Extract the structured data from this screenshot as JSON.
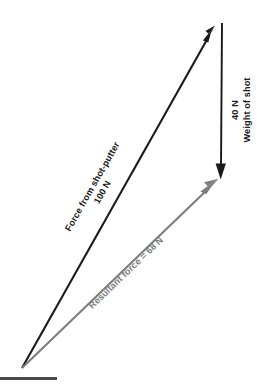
{
  "figure": {
    "type": "vector-force-diagram",
    "background_color": "#ffffff",
    "width": 264,
    "height": 392
  },
  "vectors": {
    "applied_force": {
      "label_line1": "Force from shot-putter",
      "label_line2": "100 N",
      "magnitude": "100 N",
      "color": "#1a1a1a",
      "start": {
        "x": 22,
        "y": 368
      },
      "end": {
        "x": 215,
        "y": 26
      },
      "label_rotation_deg": -60.5
    },
    "weight": {
      "label_line1": "40 N",
      "label_line2": "Weight of shot",
      "magnitude": "40 N",
      "color": "#1a1a1a",
      "start": {
        "x": 222,
        "y": 24
      },
      "end": {
        "x": 221,
        "y": 178
      },
      "label_rotation_deg": -90
    },
    "resultant": {
      "label_line1": "Resultant force = 68 N",
      "magnitude": "68 N",
      "color": "#7d7d7d",
      "start": {
        "x": 22,
        "y": 368
      },
      "end": {
        "x": 218,
        "y": 179
      },
      "label_rotation_deg": -44
    }
  },
  "ground_line": {
    "color": "#4a4a4a",
    "x1": 0,
    "y1": 379,
    "x2": 57,
    "y2": 379
  }
}
